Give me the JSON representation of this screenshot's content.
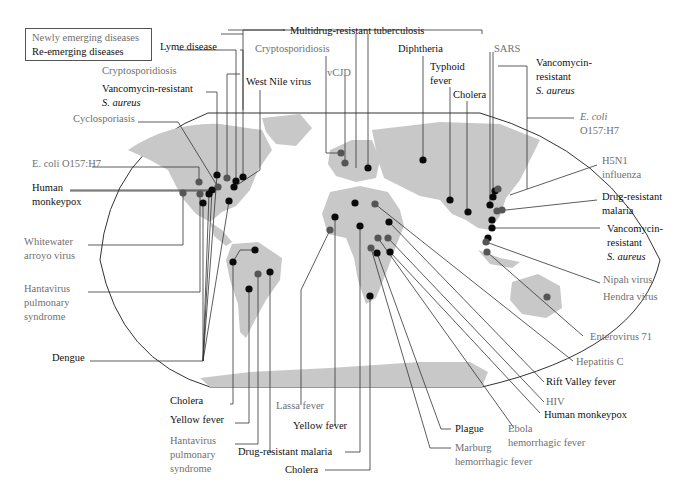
{
  "legend": {
    "newly_emerging": "Newly emerging diseases",
    "re_emerging": "Re-emerging diseases"
  },
  "colors": {
    "newly_emerging_text": "#707070",
    "re_emerging_text": "#111111",
    "newly_emerging_dot": "#555555",
    "re_emerging_dot": "#0a0a0a",
    "land": "#c8c8c8",
    "leader_line": "#333333",
    "map_outline": "#333333"
  },
  "labels": [
    {
      "id": "lyme",
      "lines": [
        "Lyme disease"
      ],
      "type": "re",
      "x": 160,
      "y": 50,
      "anchor": "start",
      "italic": []
    },
    {
      "id": "crypto-na",
      "lines": [
        "Cryptosporidiosis"
      ],
      "type": "new",
      "x": 102,
      "y": 74,
      "anchor": "start",
      "italic": []
    },
    {
      "id": "vre-na",
      "lines": [
        "Vancomycin-resistant",
        "S. aureus"
      ],
      "type": "re",
      "x": 102,
      "y": 92,
      "anchor": "start",
      "italic": [
        1
      ]
    },
    {
      "id": "cyclo",
      "lines": [
        "Cyclosporiasis"
      ],
      "type": "new",
      "x": 73,
      "y": 122,
      "anchor": "start",
      "italic": []
    },
    {
      "id": "ecoli-na",
      "lines": [
        "E. coli O157:H7"
      ],
      "type": "new",
      "x": 32,
      "y": 167,
      "anchor": "start",
      "italic": []
    },
    {
      "id": "monkeypox-na",
      "lines": [
        "Human",
        "monkeypox"
      ],
      "type": "re",
      "x": 32,
      "y": 191,
      "anchor": "start",
      "italic": []
    },
    {
      "id": "whitewater",
      "lines": [
        "Whitewater",
        "arroyo virus"
      ],
      "type": "new",
      "x": 24,
      "y": 245,
      "anchor": "start",
      "italic": []
    },
    {
      "id": "hanta-na",
      "lines": [
        "Hantavirus",
        "pulmonary",
        "syndrome"
      ],
      "type": "new",
      "x": 24,
      "y": 292,
      "anchor": "start",
      "italic": []
    },
    {
      "id": "dengue",
      "lines": [
        "Dengue"
      ],
      "type": "re",
      "x": 52,
      "y": 361,
      "anchor": "start",
      "italic": []
    },
    {
      "id": "mdr-tb",
      "lines": [
        "Multidrug-resistant tuberculosis"
      ],
      "type": "re",
      "x": 290,
      "y": 34,
      "anchor": "start",
      "italic": []
    },
    {
      "id": "crypto-eu",
      "lines": [
        "Cryptosporidiosis"
      ],
      "type": "new",
      "x": 255,
      "y": 52,
      "anchor": "start",
      "italic": []
    },
    {
      "id": "westnile",
      "lines": [
        "West Nile virus"
      ],
      "type": "re",
      "x": 246,
      "y": 85,
      "anchor": "start",
      "italic": []
    },
    {
      "id": "vcjd",
      "lines": [
        "vCJD"
      ],
      "type": "new",
      "x": 327,
      "y": 76,
      "anchor": "start",
      "italic": []
    },
    {
      "id": "diphtheria",
      "lines": [
        "Diphtheria"
      ],
      "type": "re",
      "x": 398,
      "y": 52,
      "anchor": "start",
      "italic": []
    },
    {
      "id": "typhoid",
      "lines": [
        "Typhoid",
        "fever"
      ],
      "type": "re",
      "x": 430,
      "y": 70,
      "anchor": "start",
      "italic": []
    },
    {
      "id": "cholera-asia",
      "lines": [
        "Cholera"
      ],
      "type": "re",
      "x": 453,
      "y": 98,
      "anchor": "start",
      "italic": []
    },
    {
      "id": "sars",
      "lines": [
        "SARS"
      ],
      "type": "new",
      "x": 494,
      "y": 52,
      "anchor": "start",
      "italic": []
    },
    {
      "id": "vre-asia",
      "lines": [
        "Vancomycin-",
        "resistant",
        "S. aureus"
      ],
      "type": "re",
      "x": 536,
      "y": 66,
      "anchor": "start",
      "italic": [
        2
      ]
    },
    {
      "id": "ecoli-asia",
      "lines": [
        "E. coli",
        "O157:H7"
      ],
      "type": "new",
      "x": 580,
      "y": 120,
      "anchor": "start",
      "italic": [
        0
      ]
    },
    {
      "id": "h5n1",
      "lines": [
        "H5N1",
        "influenza"
      ],
      "type": "new",
      "x": 602,
      "y": 164,
      "anchor": "start",
      "italic": []
    },
    {
      "id": "dr-malaria-asia",
      "lines": [
        "Drug-resistant",
        "malaria"
      ],
      "type": "re",
      "x": 602,
      "y": 200,
      "anchor": "start",
      "italic": []
    },
    {
      "id": "vre-sea",
      "lines": [
        "Vancomycin-",
        "resistant",
        "S. aureus"
      ],
      "type": "re",
      "x": 607,
      "y": 232,
      "anchor": "start",
      "italic": [
        2
      ]
    },
    {
      "id": "nipah",
      "lines": [
        "Nipah virus"
      ],
      "type": "new",
      "x": 603,
      "y": 283,
      "anchor": "start",
      "italic": []
    },
    {
      "id": "hendra",
      "lines": [
        "Hendra virus"
      ],
      "type": "new",
      "x": 603,
      "y": 300,
      "anchor": "start",
      "italic": []
    },
    {
      "id": "entero71",
      "lines": [
        "Enterovirus 71"
      ],
      "type": "new",
      "x": 590,
      "y": 340,
      "anchor": "start",
      "italic": []
    },
    {
      "id": "hepc",
      "lines": [
        "Hepatitis C"
      ],
      "type": "new",
      "x": 576,
      "y": 365,
      "anchor": "start",
      "italic": []
    },
    {
      "id": "riftvalley",
      "lines": [
        "Rift Valley fever"
      ],
      "type": "re",
      "x": 546,
      "y": 385,
      "anchor": "start",
      "italic": []
    },
    {
      "id": "hiv",
      "lines": [
        "HIV"
      ],
      "type": "new",
      "x": 546,
      "y": 405,
      "anchor": "start",
      "italic": []
    },
    {
      "id": "monkeypox-af",
      "lines": [
        "Human monkeypox"
      ],
      "type": "re",
      "x": 544,
      "y": 418,
      "anchor": "start",
      "italic": []
    },
    {
      "id": "plague",
      "lines": [
        "Plague"
      ],
      "type": "re",
      "x": 455,
      "y": 432,
      "anchor": "start",
      "italic": []
    },
    {
      "id": "ebola",
      "lines": [
        "Ebola",
        "hemorrhagic fever"
      ],
      "type": "new",
      "x": 508,
      "y": 432,
      "anchor": "start",
      "italic": []
    },
    {
      "id": "marburg",
      "lines": [
        "Marburg",
        "hemorrhagic fever"
      ],
      "type": "new",
      "x": 455,
      "y": 451,
      "anchor": "start",
      "italic": []
    },
    {
      "id": "lassa",
      "lines": [
        "Lassa fever"
      ],
      "type": "new",
      "x": 276,
      "y": 409,
      "anchor": "start",
      "italic": []
    },
    {
      "id": "yellow-af",
      "lines": [
        "Yellow fever"
      ],
      "type": "re",
      "x": 293,
      "y": 429,
      "anchor": "start",
      "italic": []
    },
    {
      "id": "dr-malaria-af",
      "lines": [
        "Drug-resistant malaria"
      ],
      "type": "re",
      "x": 238,
      "y": 455,
      "anchor": "start",
      "italic": []
    },
    {
      "id": "cholera-af",
      "lines": [
        "Cholera"
      ],
      "type": "re",
      "x": 285,
      "y": 473,
      "anchor": "start",
      "italic": []
    },
    {
      "id": "cholera-sa",
      "lines": [
        "Cholera"
      ],
      "type": "re",
      "x": 170,
      "y": 404,
      "anchor": "start",
      "italic": []
    },
    {
      "id": "yellow-sa",
      "lines": [
        "Yellow fever"
      ],
      "type": "re",
      "x": 170,
      "y": 423,
      "anchor": "start",
      "italic": []
    },
    {
      "id": "hanta-sa",
      "lines": [
        "Hantavirus",
        "pulmonary",
        "syndrome"
      ],
      "type": "new",
      "x": 170,
      "y": 444,
      "anchor": "start",
      "italic": []
    }
  ],
  "dots": [
    {
      "x": 217,
      "y": 175,
      "type": "re"
    },
    {
      "x": 227,
      "y": 178,
      "type": "new"
    },
    {
      "x": 236,
      "y": 181,
      "type": "re"
    },
    {
      "x": 243,
      "y": 177,
      "type": "re"
    },
    {
      "x": 199,
      "y": 182,
      "type": "new"
    },
    {
      "x": 218,
      "y": 187,
      "type": "new"
    },
    {
      "x": 234,
      "y": 187,
      "type": "re"
    },
    {
      "x": 212,
      "y": 190,
      "type": "re"
    },
    {
      "x": 183,
      "y": 193,
      "type": "new"
    },
    {
      "x": 200,
      "y": 194,
      "type": "new"
    },
    {
      "x": 209,
      "y": 194,
      "type": "re"
    },
    {
      "x": 203,
      "y": 203,
      "type": "re"
    },
    {
      "x": 229,
      "y": 201,
      "type": "re"
    },
    {
      "x": 255,
      "y": 250,
      "type": "re"
    },
    {
      "x": 233,
      "y": 262,
      "type": "re"
    },
    {
      "x": 258,
      "y": 274,
      "type": "new"
    },
    {
      "x": 270,
      "y": 272,
      "type": "re"
    },
    {
      "x": 249,
      "y": 289,
      "type": "re"
    },
    {
      "x": 341,
      "y": 153,
      "type": "new"
    },
    {
      "x": 345,
      "y": 163,
      "type": "new"
    },
    {
      "x": 368,
      "y": 168,
      "type": "re"
    },
    {
      "x": 423,
      "y": 160,
      "type": "re"
    },
    {
      "x": 450,
      "y": 200,
      "type": "re"
    },
    {
      "x": 468,
      "y": 212,
      "type": "re"
    },
    {
      "x": 355,
      "y": 203,
      "type": "re"
    },
    {
      "x": 375,
      "y": 204,
      "type": "new"
    },
    {
      "x": 335,
      "y": 217,
      "type": "re"
    },
    {
      "x": 330,
      "y": 230,
      "type": "new"
    },
    {
      "x": 360,
      "y": 226,
      "type": "re"
    },
    {
      "x": 389,
      "y": 222,
      "type": "re"
    },
    {
      "x": 378,
      "y": 238,
      "type": "new"
    },
    {
      "x": 388,
      "y": 238,
      "type": "new"
    },
    {
      "x": 371,
      "y": 248,
      "type": "new"
    },
    {
      "x": 377,
      "y": 253,
      "type": "re"
    },
    {
      "x": 390,
      "y": 252,
      "type": "re"
    },
    {
      "x": 370,
      "y": 296,
      "type": "re"
    },
    {
      "x": 490,
      "y": 205,
      "type": "re"
    },
    {
      "x": 492,
      "y": 220,
      "type": "re"
    },
    {
      "x": 488,
      "y": 238,
      "type": "re"
    },
    {
      "x": 492,
      "y": 228,
      "type": "re"
    },
    {
      "x": 497,
      "y": 211,
      "type": "new"
    },
    {
      "x": 502,
      "y": 210,
      "type": "new"
    },
    {
      "x": 493,
      "y": 197,
      "type": "re"
    },
    {
      "x": 495,
      "y": 191,
      "type": "re"
    },
    {
      "x": 498,
      "y": 189,
      "type": "new"
    },
    {
      "x": 486,
      "y": 242,
      "type": "new"
    },
    {
      "x": 487,
      "y": 252,
      "type": "new"
    },
    {
      "x": 547,
      "y": 297,
      "type": "new"
    }
  ],
  "leaders": [
    "M178,50 H236 V181",
    "M240,74 H227 V178",
    "M206,92 H217 V175",
    "M138,122 H178 L218,187",
    "M92,167 H199 V182",
    "M70,191 H212",
    "M70,190 L212,190",
    "M88,245 H183 V193",
    "M88,292 H200 V194",
    "M90,361 H203 L209,194 M203,361 L203,203 M203,361 L212,190 M203,361 L229,201 M203,361 L217,175",
    "M240,50 H243 V177",
    "M221,34 H243",
    "M228,30 H285",
    "M260,90 V170 L234,187",
    "M243,110 V30 H285",
    "M482,34 V30 H283",
    "M356,34 V168 M368,34 V168",
    "M326,56 V153 H341",
    "M345,76 V163",
    "M423,56 V160",
    "M450,87 V200",
    "M467,101 V212",
    "M490,52 V205 M493,52 V197",
    "M498,66 H527 V189",
    "M527,118 H574",
    "M510,195 L597,165",
    "M497,211 L597,200",
    "M492,228 H600",
    "M486,242 L600,283",
    "M487,252 L583,336",
    "M375,204 L573,361",
    "M389,222 L544,382",
    "M388,238 L544,402",
    "M390,252 L540,413",
    "M378,238 L514,428",
    "M377,253 L441,429 H451",
    "M371,248 L430,448 H451",
    "M330,230 L301,290 V405",
    "M335,217 V426",
    "M360,226 V452 H345",
    "M370,296 V470 H325",
    "M233,262 V404 H230",
    "M249,289 V423 H235",
    "M258,274 V444 H235",
    "M270,272 V452 H272",
    "M255,250 H240 L233,262"
  ]
}
